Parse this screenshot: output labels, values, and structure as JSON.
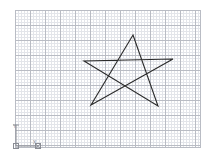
{
  "app": {
    "title": "CAD Drawing Canvas",
    "background_color": "#ffffff"
  },
  "canvas": {
    "name": "drawing-area",
    "grid": {
      "visible": true,
      "minor_spacing_px": 3,
      "major_spacing_px": 15,
      "minor_color": "#e3e5ea",
      "major_color": "#b9bcc4",
      "origin_x": 15,
      "origin_y": 10,
      "width": 186,
      "height": 138
    },
    "shape": {
      "name": "pentagram-star",
      "type": "polyline-closed",
      "stroke_color": "#2b2b2b",
      "stroke_width": 1.1,
      "fill": "none",
      "points": [
        {
          "label": "top-apex",
          "x": 133,
          "y": 35
        },
        {
          "label": "bottom-right",
          "x": 158,
          "y": 106
        },
        {
          "label": "left",
          "x": 84,
          "y": 61
        },
        {
          "label": "right",
          "x": 173,
          "y": 59
        },
        {
          "label": "bottom-left",
          "x": 91,
          "y": 105
        }
      ],
      "path": "M133,35 L158,106 L84,61 L173,59 L91,105 Z"
    }
  },
  "ucs_icon": {
    "name": "ucs-coordinate-icon",
    "color": "#8a8d94",
    "origin_x": 16,
    "origin_y": 146,
    "x_axis_label": "X",
    "y_axis_label": "Y",
    "x_axis_length": 22,
    "y_axis_length": 20
  }
}
